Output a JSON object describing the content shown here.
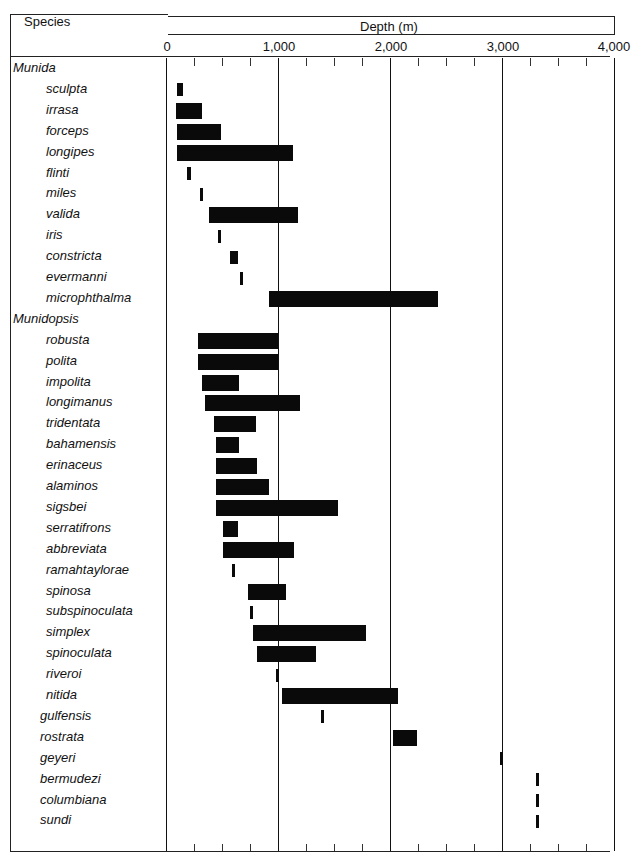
{
  "header": {
    "species_label": "Species",
    "depth_label": "Depth (m)"
  },
  "axis": {
    "ticks": [
      "0",
      "1,000",
      "2,000",
      "3,000",
      "4,000"
    ]
  },
  "chart_data": {
    "type": "bar",
    "orientation": "horizontal-range",
    "title": "",
    "xlabel": "Depth (m)",
    "ylabel": "Species",
    "xlim": [
      0,
      4000
    ],
    "x_ticks": [
      0,
      1000,
      2000,
      3000,
      4000
    ],
    "minor_tick_interval": 250,
    "grid": "vertical major lines at 1000, 2000, 3000",
    "groups": [
      {
        "genus": "Munida",
        "species": [
          {
            "name": "sculpta",
            "min": 100,
            "max": 150
          },
          {
            "name": "irrasa",
            "min": 90,
            "max": 320
          },
          {
            "name": "forceps",
            "min": 100,
            "max": 490
          },
          {
            "name": "longipes",
            "min": 100,
            "max": 1130
          },
          {
            "name": "flinti",
            "min": 190,
            "max": 220
          },
          {
            "name": "miles",
            "min": 300,
            "max": 330
          },
          {
            "name": "valida",
            "min": 380,
            "max": 1180
          },
          {
            "name": "iris",
            "min": 460,
            "max": 490
          },
          {
            "name": "constricta",
            "min": 570,
            "max": 640
          },
          {
            "name": "evermanni",
            "min": 660,
            "max": 690
          },
          {
            "name": "microphthalma",
            "min": 920,
            "max": 2430
          }
        ]
      },
      {
        "genus": "Munidopsis",
        "species": [
          {
            "name": "robusta",
            "min": 290,
            "max": 1000
          },
          {
            "name": "polita",
            "min": 290,
            "max": 1000
          },
          {
            "name": "impolita",
            "min": 320,
            "max": 650
          },
          {
            "name": "longimanus",
            "min": 350,
            "max": 1200
          },
          {
            "name": "tridentata",
            "min": 430,
            "max": 800
          },
          {
            "name": "bahamensis",
            "min": 450,
            "max": 650
          },
          {
            "name": "erinaceus",
            "min": 450,
            "max": 810
          },
          {
            "name": "alaminos",
            "min": 450,
            "max": 920
          },
          {
            "name": "sigsbei",
            "min": 450,
            "max": 1540
          },
          {
            "name": "serratifrons",
            "min": 510,
            "max": 640
          },
          {
            "name": "abbreviata",
            "min": 510,
            "max": 1140
          },
          {
            "name": "ramahtaylorae",
            "min": 590,
            "max": 620
          },
          {
            "name": "spinosa",
            "min": 730,
            "max": 1070
          },
          {
            "name": "subspinoculata",
            "min": 750,
            "max": 780
          },
          {
            "name": "simplex",
            "min": 780,
            "max": 1790
          },
          {
            "name": "spinoculata",
            "min": 810,
            "max": 1340
          },
          {
            "name": "riveroi",
            "min": 980,
            "max": 1010
          },
          {
            "name": "nitida",
            "min": 1040,
            "max": 2070
          },
          {
            "name": "gulfensis",
            "min": 1380,
            "max": 1400
          },
          {
            "name": "rostrata",
            "min": 2030,
            "max": 2240
          },
          {
            "name": "geyeri",
            "min": 2980,
            "max": 3010
          },
          {
            "name": "bermudezi",
            "min": 3300,
            "max": 3330
          },
          {
            "name": "columbiana",
            "min": 3300,
            "max": 3330
          },
          {
            "name": "sundi",
            "min": 3300,
            "max": 3330
          }
        ]
      }
    ]
  }
}
